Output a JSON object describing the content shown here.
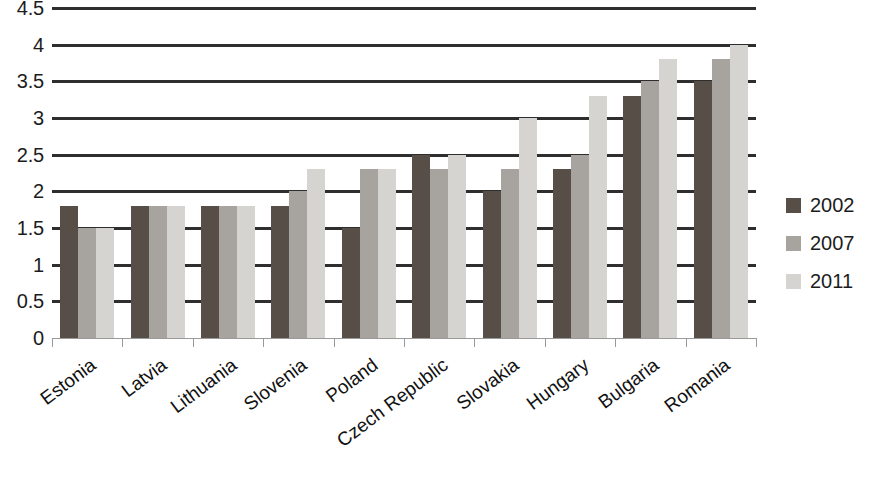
{
  "chart_data": {
    "type": "bar",
    "title": "",
    "subtitle": "",
    "xlabel": "",
    "ylabel": "",
    "ylim": [
      0,
      4.5
    ],
    "ytick_step": 0.5,
    "yticks": [
      "4.5",
      "4",
      "3.5",
      "3",
      "2.5",
      "2",
      "1.5",
      "1",
      "0.5",
      "0"
    ],
    "ytick_values": [
      4.5,
      4,
      3.5,
      3,
      2.5,
      2,
      1.5,
      1,
      0.5,
      0
    ],
    "grid": true,
    "grid_axis": "y",
    "legend_position": "right",
    "categories": [
      "Estonia",
      "Latvia",
      "Lithuania",
      "Slovenia",
      "Poland",
      "Czech Republic",
      "Slovakia",
      "Hungary",
      "Bulgaria",
      "Romania"
    ],
    "series": [
      {
        "name": "2002",
        "color": "#574e47",
        "values": [
          1.8,
          1.8,
          1.8,
          1.8,
          1.5,
          2.5,
          2.0,
          2.3,
          3.3,
          3.5
        ]
      },
      {
        "name": "2007",
        "color": "#a7a49f",
        "values": [
          1.5,
          1.8,
          1.8,
          2.0,
          2.3,
          2.3,
          2.3,
          2.5,
          3.5,
          3.8
        ]
      },
      {
        "name": "2011",
        "color": "#d6d4d1",
        "values": [
          1.5,
          1.8,
          1.8,
          2.3,
          2.3,
          2.5,
          3.0,
          3.3,
          3.8,
          4.0
        ]
      }
    ]
  },
  "legend": {
    "items": [
      {
        "label": "2002",
        "color": "#574e47"
      },
      {
        "label": "2007",
        "color": "#a7a49f"
      },
      {
        "label": "2011",
        "color": "#d6d4d1"
      }
    ]
  }
}
